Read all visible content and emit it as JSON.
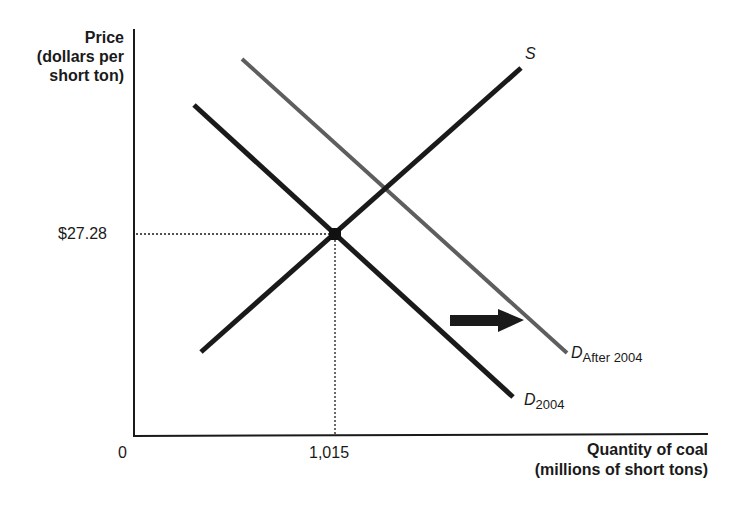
{
  "diagram": {
    "type": "supply-demand",
    "y_axis": {
      "label_line1": "Price",
      "label_line2": "(dollars per",
      "label_line3": "short ton)"
    },
    "x_axis": {
      "label_line1": "Quantity of coal",
      "label_line2": "(millions of short tons)"
    },
    "origin_label": "0",
    "equilibrium": {
      "price_label": "$27.28",
      "quantity_label": "1,015"
    },
    "curves": {
      "supply": {
        "label": "S",
        "color": "#1a1a1a"
      },
      "demand_2004": {
        "label_main": "D",
        "label_sub": "2004",
        "color": "#1a1a1a"
      },
      "demand_after": {
        "label_main": "D",
        "label_sub": "After 2004",
        "color": "#6b6b6b"
      }
    },
    "shift_arrow": {
      "direction": "right",
      "meaning": "demand increase"
    }
  }
}
